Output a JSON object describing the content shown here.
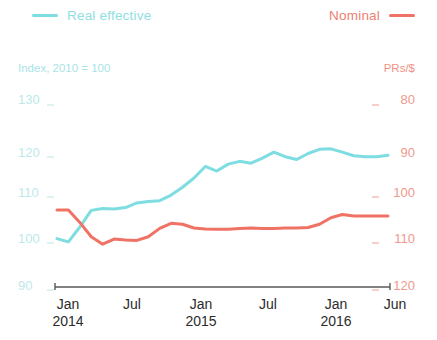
{
  "legend": {
    "left": {
      "label": "Real effective",
      "color": "#7DDDE0",
      "marker": "line-swatch"
    },
    "right": {
      "label": "Nominal",
      "color": "#EF7264",
      "marker": "line-swatch"
    }
  },
  "axis_titles": {
    "left": "Index, 2010 = 100",
    "right": "PRs/$"
  },
  "left_axis": {
    "ticks": [
      "130",
      "120",
      "110",
      "100",
      "90"
    ],
    "values": [
      130,
      120,
      110,
      100,
      90
    ],
    "color": "#BCE9EA"
  },
  "right_axis": {
    "ticks": [
      "80",
      "90",
      "100",
      "110",
      "120"
    ],
    "values": [
      80,
      90,
      100,
      110,
      120
    ],
    "color": "#F0998C"
  },
  "x_axis": {
    "labels": [
      {
        "month": "Jan",
        "year": "2014"
      },
      {
        "month": "Jul",
        "year": ""
      },
      {
        "month": "Jan",
        "year": "2015"
      },
      {
        "month": "Jul",
        "year": ""
      },
      {
        "month": "Jan",
        "year": "2016"
      },
      {
        "month": "Jun",
        "year": ""
      }
    ]
  },
  "chart_data": {
    "type": "line",
    "title": "",
    "subtitle": "",
    "xlabel": "",
    "ylabel": "Index, 2010 = 100",
    "y2label": "PRs/$",
    "ylim": [
      90,
      130
    ],
    "y2lim": [
      120,
      80
    ],
    "y2_inverted": true,
    "grid": false,
    "legend_position": "top",
    "x": [
      "Jan 2014",
      "Feb 2014",
      "Mar 2014",
      "Apr 2014",
      "May 2014",
      "Jun 2014",
      "Jul 2014",
      "Aug 2014",
      "Sep 2014",
      "Oct 2014",
      "Nov 2014",
      "Dec 2014",
      "Jan 2015",
      "Feb 2015",
      "Mar 2015",
      "Apr 2015",
      "May 2015",
      "Jun 2015",
      "Jul 2015",
      "Aug 2015",
      "Sep 2015",
      "Oct 2015",
      "Nov 2015",
      "Dec 2015",
      "Jan 2016",
      "Feb 2016",
      "Mar 2016",
      "Apr 2016",
      "May 2016",
      "Jun 2016"
    ],
    "series": [
      {
        "name": "Real effective",
        "color": "#7DDDE0",
        "axis": "left",
        "unit": "Index, 2010 = 100",
        "values": [
          100.9,
          100.2,
          103.4,
          107.0,
          107.4,
          107.3,
          107.6,
          108.6,
          108.9,
          109.1,
          110.3,
          112.0,
          114.0,
          116.5,
          115.5,
          117.0,
          117.6,
          117.2,
          118.3,
          119.6,
          118.6,
          118.0,
          119.3,
          120.2,
          120.3,
          119.6,
          118.8,
          118.6,
          118.6,
          118.9
        ]
      },
      {
        "name": "Nominal",
        "color": "#EF7264",
        "axis": "right",
        "unit": "PRs/$",
        "values": [
          102.9,
          102.9,
          105.6,
          108.7,
          110.3,
          109.2,
          109.4,
          109.5,
          108.7,
          106.9,
          105.8,
          106.0,
          106.8,
          107.0,
          107.1,
          107.1,
          106.9,
          106.8,
          106.9,
          106.9,
          106.8,
          106.8,
          106.7,
          106.0,
          104.6,
          103.9,
          104.2,
          104.2,
          104.2,
          104.2
        ]
      }
    ]
  }
}
